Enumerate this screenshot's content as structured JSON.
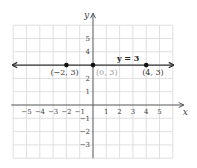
{
  "chart_data": {
    "type": "line",
    "title": "",
    "xlabel": "x",
    "ylabel": "y",
    "xlim": [
      -6,
      6
    ],
    "ylim": [
      -4,
      6
    ],
    "grid": true,
    "x_ticks": [
      -5,
      -4,
      -3,
      -2,
      -1,
      1,
      2,
      3,
      4,
      5
    ],
    "y_ticks": [
      -3,
      -2,
      -1,
      1,
      2,
      4,
      5
    ],
    "x_tick_labels": [
      "−5",
      "−4",
      "−3",
      "−2",
      "−1",
      "1",
      "2",
      "3",
      "4",
      "5"
    ],
    "y_tick_labels": [
      "−3",
      "−2",
      "−1",
      "1",
      "2",
      "4",
      "5"
    ],
    "series": [
      {
        "name": "y = 3",
        "equation": "y = 3",
        "line": "horizontal",
        "y": 3,
        "arrows_both_ends": true,
        "color": "#333333"
      }
    ],
    "points": [
      {
        "x": -2,
        "y": 3,
        "label": "(−2, 3)",
        "label_color": "#333333"
      },
      {
        "x": 0,
        "y": 3,
        "label": "(0, 3)",
        "label_color": "#999999"
      },
      {
        "x": 4,
        "y": 3,
        "label": "(4, 3)",
        "label_color": "#333333"
      }
    ],
    "annotations": [
      {
        "text": "y = 3",
        "x": 1.8,
        "y": 3.4
      }
    ]
  },
  "colors": {
    "grid": "#d8d8d8",
    "axis": "#555555",
    "line": "#333333",
    "point": "#111111",
    "label": "#444444",
    "label_muted": "#999999"
  }
}
